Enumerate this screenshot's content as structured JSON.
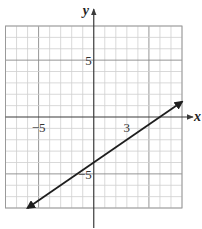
{
  "chart_data": {
    "type": "line",
    "title": "",
    "xlabel": "x",
    "ylabel": "y",
    "xlim": [
      -8,
      8
    ],
    "ylim": [
      -8,
      8
    ],
    "grid": true,
    "grid_minor_step": 1,
    "grid_major_step": 5,
    "tick_labels": [
      {
        "axis": "x",
        "value": -5,
        "text": "−5"
      },
      {
        "axis": "x",
        "value": 3,
        "text": "3"
      },
      {
        "axis": "y",
        "value": 5,
        "text": "5"
      },
      {
        "axis": "y",
        "value": -5,
        "text": "−5"
      }
    ],
    "series": [
      {
        "name": "line",
        "equation": "y = (2/3)x - 4",
        "slope": 0.6667,
        "y_intercept": -4,
        "x_intercept": 6,
        "x": [
          -6,
          8
        ],
        "y": [
          -8,
          1.333
        ],
        "arrows": "both",
        "color": "#1e1e1e"
      }
    ],
    "legend": null
  },
  "colors": {
    "grid_minor": "#cfcfcf",
    "grid_major": "#8a8a8a",
    "axis": "#3a3a3a",
    "line": "#1e1e1e"
  }
}
